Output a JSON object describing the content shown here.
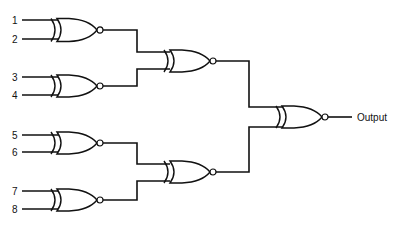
{
  "diagram": {
    "gate_type": "xnor-icon",
    "inputs": [
      {
        "label": "1",
        "y": 20
      },
      {
        "label": "2",
        "y": 39
      },
      {
        "label": "3",
        "y": 77
      },
      {
        "label": "4",
        "y": 95
      },
      {
        "label": "5",
        "y": 135
      },
      {
        "label": "6",
        "y": 152
      },
      {
        "label": "7",
        "y": 191
      },
      {
        "label": "8",
        "y": 209
      }
    ],
    "output_label": "Output",
    "gates": [
      {
        "id": "g1",
        "level": 1,
        "inputs": [
          "1",
          "2"
        ]
      },
      {
        "id": "g2",
        "level": 1,
        "inputs": [
          "3",
          "4"
        ]
      },
      {
        "id": "g3",
        "level": 1,
        "inputs": [
          "5",
          "6"
        ]
      },
      {
        "id": "g4",
        "level": 1,
        "inputs": [
          "7",
          "8"
        ]
      },
      {
        "id": "g5",
        "level": 2,
        "inputs": [
          "g1",
          "g2"
        ]
      },
      {
        "id": "g6",
        "level": 2,
        "inputs": [
          "g3",
          "g4"
        ]
      },
      {
        "id": "g7",
        "level": 3,
        "inputs": [
          "g5",
          "g6"
        ],
        "output": "Output"
      }
    ]
  }
}
